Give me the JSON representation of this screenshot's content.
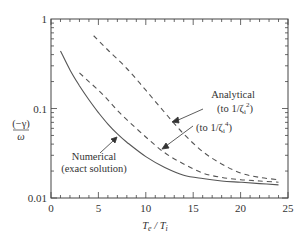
{
  "chart_data": {
    "type": "line",
    "title": "",
    "xlabel": "T_e / T_i",
    "ylabel": "(−γ) / ω",
    "xlim": [
      0,
      25
    ],
    "ylim": [
      0.01,
      1
    ],
    "yscale": "log",
    "grid": false,
    "x_ticks": [
      "0",
      "5",
      "10",
      "15",
      "20",
      "25"
    ],
    "y_ticks": [
      "0.01",
      "0.1",
      "1"
    ],
    "series": [
      {
        "name": "Numerical (exact solution)",
        "style": "solid",
        "x": [
          1,
          2,
          3,
          4,
          5,
          6,
          7,
          8,
          10,
          12,
          14,
          16,
          18,
          20,
          22,
          24
        ],
        "values": [
          0.44,
          0.27,
          0.18,
          0.125,
          0.09,
          0.067,
          0.052,
          0.042,
          0.029,
          0.022,
          0.018,
          0.0165,
          0.0155,
          0.015,
          0.0145,
          0.014
        ]
      },
      {
        "name": "Analytical (to 1/ζi^4)",
        "style": "dashed",
        "x": [
          3,
          4,
          5,
          6,
          7,
          8,
          10,
          12,
          14,
          16,
          18,
          20,
          22,
          24
        ],
        "values": [
          0.25,
          0.2,
          0.16,
          0.125,
          0.095,
          0.075,
          0.048,
          0.032,
          0.024,
          0.019,
          0.017,
          0.016,
          0.0155,
          0.015
        ]
      },
      {
        "name": "Analytical (to 1/ζi^2)",
        "style": "dashed",
        "x": [
          4.5,
          6,
          8,
          10,
          12,
          14,
          16,
          18,
          20,
          22,
          24
        ],
        "values": [
          0.65,
          0.45,
          0.28,
          0.16,
          0.09,
          0.052,
          0.033,
          0.024,
          0.019,
          0.017,
          0.016
        ]
      }
    ],
    "annotations": [
      {
        "text": [
          "Analytical",
          "(to 1/ζi²)"
        ],
        "target_series": "Analytical (to 1/ζi^2)"
      },
      {
        "text": [
          "(to 1/ζi⁴)"
        ],
        "target_series": "Analytical (to 1/ζi^4)"
      },
      {
        "text": [
          "Numerical",
          "(exact solution)"
        ],
        "target_series": "Numerical (exact solution)"
      }
    ]
  },
  "labels": {
    "y_axis_num": "(−γ)",
    "y_axis_den": "ω",
    "x_axis_main": "T",
    "x_axis_sub1": "e",
    "x_axis_mid": " / T",
    "x_axis_sub2": "i",
    "ann_analytical": "Analytical",
    "ann_to2": "(to 1/ζ",
    "ann_to2_sub": "i",
    "ann_to2_sup": "2",
    "ann_to4": "(to 1/ζ",
    "ann_to4_sub": "i",
    "ann_to4_sup": "4",
    "ann_close": ")",
    "ann_numerical": "Numerical",
    "ann_exact": "(exact solution)"
  }
}
